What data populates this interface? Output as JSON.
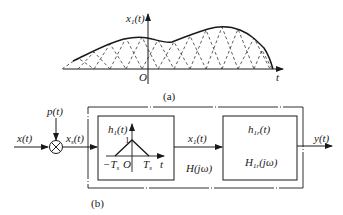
{
  "figure_a": {
    "caption": "(a)",
    "y_axis_label": "x",
    "y_axis_label_sub": "1",
    "y_axis_label_arg": "(t)",
    "origin_label": "O",
    "x_axis_label": "t",
    "curve_description": "smooth envelope reconstructed from overlapping triangular pulses"
  },
  "figure_b": {
    "caption": "(b)",
    "input_label": "x(t)",
    "carrier_label": "p(t)",
    "sampled_label": "x",
    "sampled_label_sub": "s",
    "sampled_label_arg": "(t)",
    "multiplier_symbol": "⊗",
    "block1": {
      "impulse_label": "h",
      "impulse_label_sub": "1",
      "impulse_label_arg": "(t)",
      "peak_label": "1",
      "neg_ts_label": "−T",
      "neg_ts_sub": "s",
      "origin_label": "O",
      "pos_ts_label": "T",
      "pos_ts_sub": "s",
      "t_label": "t"
    },
    "intermediate_label": "x",
    "intermediate_label_sub": "1",
    "intermediate_label_arg": "(t)",
    "system_label": "H(jω)",
    "block2": {
      "impulse_label": "h",
      "impulse_label_sub": "1r",
      "impulse_label_arg": "(t)",
      "freq_label": "H",
      "freq_label_sub": "1r",
      "freq_label_arg": "(jω)"
    },
    "output_label": "y(t)"
  }
}
